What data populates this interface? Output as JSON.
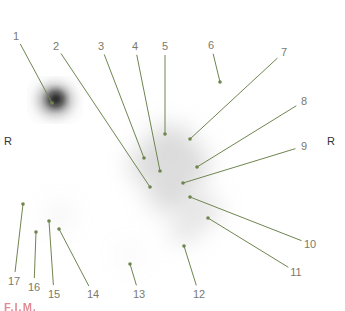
{
  "figure": {
    "title_fragment": "F.I.M.",
    "accent_color": "#c8283c",
    "line_color": "#6f8550",
    "text_color": "#7a7a6e"
  },
  "orientation": {
    "left": "R",
    "right": "R"
  },
  "labels": [
    {
      "id": "1",
      "text": "1",
      "lx": 16,
      "ly": 36,
      "dx": 52,
      "dy": 103
    },
    {
      "id": "2",
      "text": "2",
      "lx": 56,
      "ly": 46,
      "dx": 150,
      "dy": 187
    },
    {
      "id": "3",
      "text": "3",
      "lx": 101,
      "ly": 46,
      "dx": 144,
      "dy": 158
    },
    {
      "id": "4",
      "text": "4",
      "lx": 135,
      "ly": 46,
      "dx": 160,
      "dy": 171
    },
    {
      "id": "5",
      "text": "5",
      "lx": 165,
      "ly": 46,
      "dx": 165,
      "dy": 134
    },
    {
      "id": "6",
      "text": "6",
      "lx": 211,
      "ly": 45,
      "dx": 220,
      "dy": 82
    },
    {
      "id": "7",
      "text": "7",
      "lx": 284,
      "ly": 52,
      "dx": 190,
      "dy": 139
    },
    {
      "id": "8",
      "text": "8",
      "lx": 304,
      "ly": 101,
      "dx": 197,
      "dy": 167
    },
    {
      "id": "9",
      "text": "9",
      "lx": 304,
      "ly": 146,
      "dx": 183,
      "dy": 183
    },
    {
      "id": "10",
      "text": "10",
      "lx": 310,
      "ly": 244,
      "dx": 190,
      "dy": 197
    },
    {
      "id": "11",
      "text": "11",
      "lx": 296,
      "ly": 272,
      "dx": 208,
      "dy": 218
    },
    {
      "id": "12",
      "text": "12",
      "lx": 199,
      "ly": 294,
      "dx": 184,
      "dy": 246
    },
    {
      "id": "13",
      "text": "13",
      "lx": 139,
      "ly": 294,
      "dx": 130,
      "dy": 264
    },
    {
      "id": "14",
      "text": "14",
      "lx": 93,
      "ly": 294,
      "dx": 59,
      "dy": 229
    },
    {
      "id": "15",
      "text": "15",
      "lx": 54,
      "ly": 294,
      "dx": 49,
      "dy": 221
    },
    {
      "id": "16",
      "text": "16",
      "lx": 34,
      "ly": 287,
      "dx": 36,
      "dy": 232
    },
    {
      "id": "17",
      "text": "17",
      "lx": 14,
      "ly": 281,
      "dx": 23,
      "dy": 204
    }
  ]
}
